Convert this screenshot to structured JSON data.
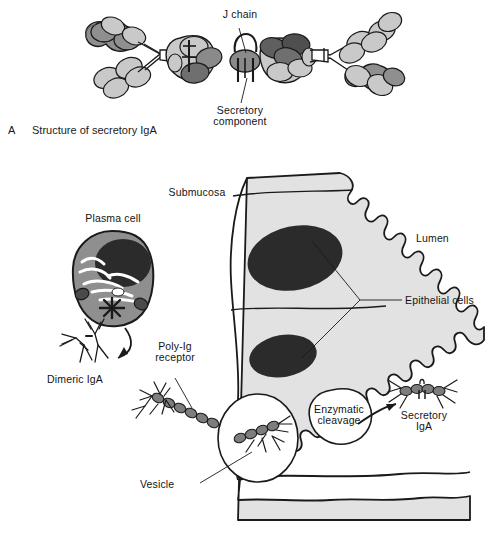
{
  "figure": {
    "panel_a": {
      "letter": "A",
      "caption": "Structure of secretory IgA",
      "labels": {
        "j_chain": "J chain",
        "secretory_component_line1": "Secretory",
        "secretory_component_line2": "component"
      }
    },
    "panel_b": {
      "labels": {
        "submucosa": "Submucosa",
        "plasma_cell": "Plasma cell",
        "dimeric_iga": "Dimeric IgA",
        "poly_ig_receptor_line1": "Poly-Ig",
        "poly_ig_receptor_line2": "receptor",
        "vesicle": "Vesicle",
        "enzymatic_cleavage_line1": "Enzymatic",
        "enzymatic_cleavage_line2": "cleavage",
        "lumen": "Lumen",
        "epithelial_cells": "Epithelial cells",
        "secretory_iga_line1": "Secretory",
        "secretory_iga_line2": "IgA"
      }
    },
    "bottom_caption": ""
  },
  "colors": {
    "stroke": "#1a1a1a",
    "cell_fill": "#e2e2e2",
    "nucleus_fill": "#2b2b2b",
    "cytoplasm_fill": "#8f8f8f",
    "domain_dark": "#8a8a8a",
    "domain_light": "#c9c9c9",
    "domain_darker": "#6f6f6f",
    "receptor_bead": "#7d7d7d",
    "background": "#ffffff",
    "text": "#141414"
  }
}
